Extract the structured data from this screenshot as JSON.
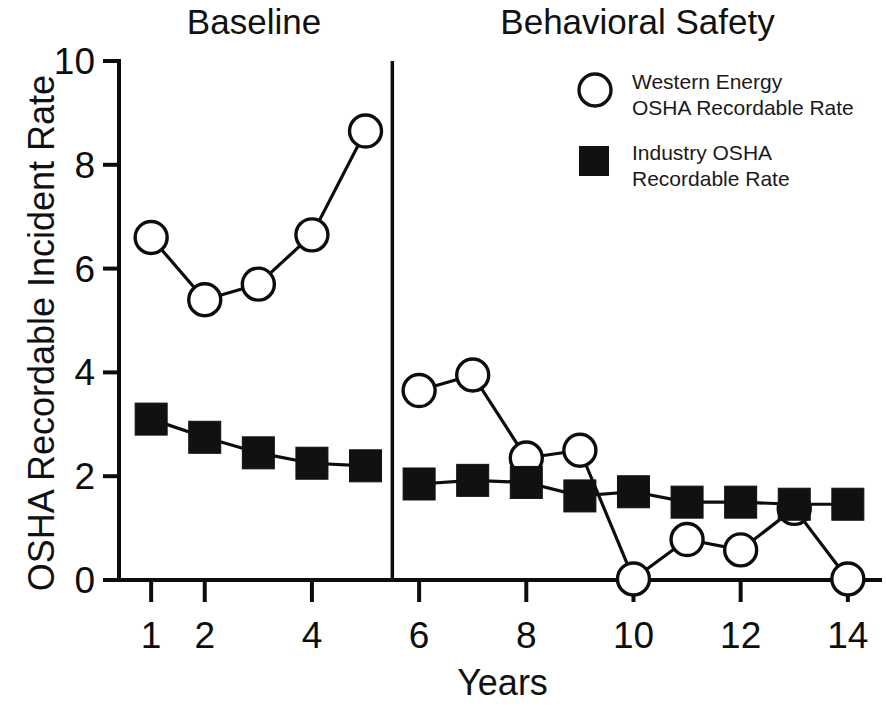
{
  "chart_data": {
    "type": "line",
    "title": "",
    "xlabel": "Years",
    "ylabel": "OSHA Recordable Incident Rate",
    "xlim": [
      0.4,
      14.6
    ],
    "ylim": [
      0,
      10
    ],
    "grid": false,
    "legend_position": "top-right",
    "x": [
      1,
      2,
      3,
      4,
      5,
      6,
      7,
      8,
      9,
      10,
      11,
      12,
      13,
      14
    ],
    "x_tick_labels": [
      "1",
      "2",
      "4",
      "6",
      "8",
      "10",
      "12",
      "14"
    ],
    "x_tick_values": [
      1,
      2,
      4,
      6,
      8,
      10,
      12,
      14
    ],
    "x_minor_tick_values": [
      3,
      5,
      7,
      9,
      11,
      13
    ],
    "y_tick_labels": [
      "0",
      "2",
      "4",
      "6",
      "8",
      "10"
    ],
    "y_tick_values": [
      0,
      2,
      4,
      6,
      8,
      10
    ],
    "phases": [
      {
        "name": "Baseline",
        "x_start": 0.4,
        "x_end": 5.5
      },
      {
        "name": "Behavioral Safety",
        "x_start": 5.5,
        "x_end": 14.6
      }
    ],
    "phase_divider_x": 5.5,
    "series": [
      {
        "name": "Western Energy\nOSHA Recordable Rate",
        "marker": "open-circle",
        "color": "#111111",
        "segments": [
          {
            "x": [
              1,
              2,
              3,
              4,
              5
            ],
            "values": [
              6.6,
              5.4,
              5.7,
              6.65,
              8.65
            ]
          },
          {
            "x": [
              6,
              7,
              8,
              9,
              10,
              11,
              12,
              13,
              14
            ],
            "values": [
              3.65,
              3.95,
              2.35,
              2.5,
              0.02,
              0.78,
              0.58,
              1.38,
              0.02
            ]
          }
        ]
      },
      {
        "name": "Industry OSHA\nRecordable Rate",
        "marker": "filled-square",
        "color": "#111111",
        "segments": [
          {
            "x": [
              1,
              2,
              3,
              4,
              5
            ],
            "values": [
              3.1,
              2.75,
              2.45,
              2.25,
              2.2
            ]
          },
          {
            "x": [
              6,
              7,
              8,
              9,
              10,
              11,
              12,
              13,
              14
            ],
            "values": [
              1.85,
              1.92,
              1.88,
              1.62,
              1.7,
              1.5,
              1.5,
              1.46,
              1.46
            ]
          }
        ]
      }
    ]
  },
  "legend": {
    "items": [
      {
        "marker": "open-circle",
        "label": "Western Energy\nOSHA Recordable Rate"
      },
      {
        "marker": "filled-square",
        "label": "Industry OSHA\nRecordable Rate"
      }
    ]
  },
  "axes": {
    "y_title": "OSHA Recordable Incident Rate",
    "x_title": "Years"
  },
  "phase_titles": {
    "baseline": "Baseline",
    "behavioral": "Behavioral Safety"
  }
}
